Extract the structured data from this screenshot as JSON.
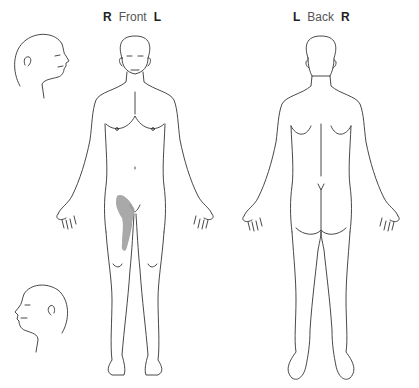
{
  "front_view": {
    "left_marker": "R",
    "title": "Front",
    "right_marker": "L"
  },
  "back_view": {
    "left_marker": "L",
    "title": "Back",
    "right_marker": "R"
  },
  "head_profiles": [
    {
      "name": "head-profile-right-facing",
      "facing": "right"
    },
    {
      "name": "head-profile-left-facing",
      "facing": "left"
    }
  ],
  "marked_regions": [
    {
      "view": "front",
      "region": "right upper thigh / groin (patient's right)",
      "color": "#9a9a9a"
    }
  ],
  "colors": {
    "outline": "#333333",
    "shading": "#9a9a9a",
    "background": "#ffffff"
  }
}
